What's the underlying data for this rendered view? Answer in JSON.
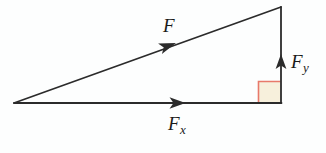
{
  "figure": {
    "name": "force-vector-decomposition-triangle",
    "background_color": "#fdfefe",
    "line_color": "#2b2b2b",
    "right_angle_marker": {
      "border_color": "#e8796a",
      "fill_color": "#f7f0dc",
      "x": 258,
      "y": 81,
      "size": 22
    },
    "geometry": {
      "left_vertex": {
        "x": 14,
        "y": 103
      },
      "apex_vertex": {
        "x": 281,
        "y": 7
      },
      "right_vertex": {
        "x": 281,
        "y": 103
      }
    },
    "labels": [
      {
        "id": "F",
        "name": "force-resultant-label",
        "base": "F",
        "subscript": "",
        "meaning": "resultant force vector along hypotenuse"
      },
      {
        "id": "Fx",
        "name": "force-x-component-label",
        "base": "F",
        "subscript": "x",
        "meaning": "horizontal component of force"
      },
      {
        "id": "Fy",
        "name": "force-y-component-label",
        "base": "F",
        "subscript": "y",
        "meaning": "vertical component of force"
      }
    ],
    "arrows": [
      {
        "name": "hypotenuse-arrow",
        "direction": "up-right",
        "tip": {
          "x": 176,
          "y": 43
        }
      },
      {
        "name": "horizontal-arrow",
        "direction": "right",
        "tip": {
          "x": 185,
          "y": 103
        }
      },
      {
        "name": "vertical-arrow",
        "direction": "up",
        "tip": {
          "x": 281,
          "y": 54
        }
      }
    ]
  }
}
